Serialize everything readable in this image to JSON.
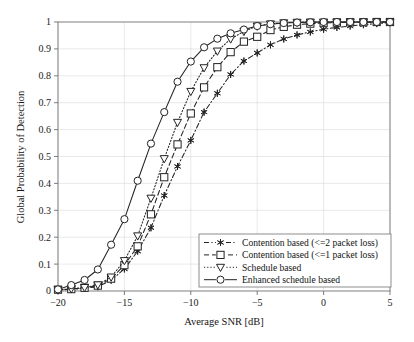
{
  "chart_data": {
    "type": "line",
    "title": "",
    "xlabel": "Average SNR [dB]",
    "ylabel": "Global Probability of Detection",
    "xlim": [
      -20,
      5
    ],
    "ylim": [
      0,
      1
    ],
    "xticks": [
      -20,
      -15,
      -10,
      -5,
      0,
      5
    ],
    "xticklabels": [
      "−20",
      "−15",
      "−10",
      "−5",
      "0",
      "5"
    ],
    "yticks": [
      0,
      0.1,
      0.2,
      0.3,
      0.4,
      0.5,
      0.6,
      0.7,
      0.8,
      0.9,
      1
    ],
    "yticklabels": [
      "0",
      "0.1",
      "0.2",
      "0.3",
      "0.4",
      "0.5",
      "0.6",
      "0.7",
      "0.8",
      "0.9",
      "1"
    ],
    "grid": true,
    "legend_position": "lower right",
    "x": [
      -20,
      -19,
      -18,
      -17,
      -16,
      -15,
      -14,
      -13,
      -12,
      -11,
      -10,
      -9,
      -8,
      -7,
      -6,
      -5,
      -4,
      -3,
      -2,
      -1,
      0,
      1,
      2,
      3,
      4,
      5
    ],
    "series": [
      {
        "name": "Contention based (<=2 packet loss)",
        "marker": "star",
        "linestyle": "dashdot",
        "color": "#232323",
        "values": [
          0.004,
          0.006,
          0.01,
          0.016,
          0.04,
          0.082,
          0.148,
          0.235,
          0.355,
          0.463,
          0.56,
          0.665,
          0.735,
          0.805,
          0.855,
          0.885,
          0.915,
          0.937,
          0.952,
          0.963,
          0.973,
          0.98,
          0.985,
          0.99,
          0.994,
          0.998
        ]
      },
      {
        "name": "Contention based (<=1 packet loss)",
        "marker": "square",
        "linestyle": "dashed",
        "color": "#232323",
        "values": [
          0.005,
          0.007,
          0.012,
          0.02,
          0.046,
          0.096,
          0.166,
          0.285,
          0.423,
          0.545,
          0.66,
          0.757,
          0.832,
          0.888,
          0.927,
          0.945,
          0.97,
          0.982,
          0.99,
          0.994,
          0.996,
          0.998,
          0.999,
          0.999,
          1.0,
          1.0
        ]
      },
      {
        "name": "Schedule based",
        "marker": "triangle-down",
        "linestyle": "dotted",
        "color": "#232323",
        "values": [
          0.005,
          0.008,
          0.013,
          0.023,
          0.052,
          0.113,
          0.205,
          0.345,
          0.492,
          0.627,
          0.742,
          0.83,
          0.892,
          0.937,
          0.965,
          0.985,
          0.993,
          0.997,
          0.999,
          1.0,
          1.0,
          1.0,
          1.0,
          1.0,
          1.0,
          1.0
        ]
      },
      {
        "name": "Enhanced schedule based",
        "marker": "circle",
        "linestyle": "solid",
        "color": "#232323",
        "values": [
          0.006,
          0.022,
          0.041,
          0.08,
          0.172,
          0.267,
          0.41,
          0.548,
          0.665,
          0.778,
          0.853,
          0.906,
          0.938,
          0.958,
          0.972,
          0.985,
          0.992,
          0.996,
          0.998,
          0.999,
          1.0,
          1.0,
          1.0,
          1.0,
          1.0,
          1.0
        ]
      }
    ],
    "legend": [
      "Contention based (<=2 packet loss)",
      "Contention based (<=1 packet loss)",
      "Schedule based",
      "Enhanced schedule based"
    ]
  },
  "figure": {
    "background_color": "#ffffff",
    "axis_color": "#8a8a8a",
    "grid_color": "#d8d8d8",
    "line_color": "#232323"
  }
}
